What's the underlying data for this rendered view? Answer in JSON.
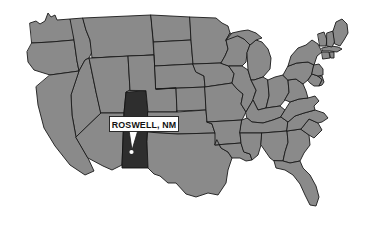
{
  "figure": {
    "type": "map",
    "region": "United States",
    "background_color": "#ffffff",
    "state_fill_color": "#8a8a8a",
    "state_border_color": "#1a1a1a",
    "highlight_fill_color": "#2e2e2e",
    "water_color": "#ffffff",
    "marker_color": "#ffffff"
  },
  "callout": {
    "label": "ROSWELL, NM",
    "box_fill": "#ffffff",
    "box_border": "#1a1a1a",
    "text_color": "#111111"
  },
  "marker": {
    "name": "Roswell",
    "state": "NM",
    "dot_color": "#ffffff"
  },
  "highlighted_state": {
    "name": "New Mexico",
    "abbreviation": "NM"
  }
}
